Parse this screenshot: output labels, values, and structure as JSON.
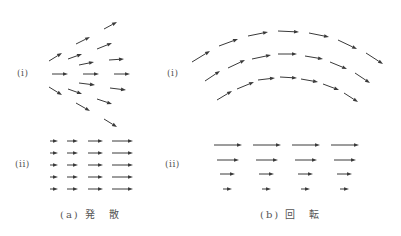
{
  "colors": {
    "arrow": "#3a3a3a",
    "text": "#555555",
    "background": "#ffffff"
  },
  "panels": {
    "a": {
      "caption": "(a) 発　散",
      "sub_i_label": "(i)",
      "sub_ii_label": "(ii)"
    },
    "b": {
      "caption": "(b) 回　転",
      "sub_i_label": "(i)",
      "sub_ii_label": "(ii)"
    }
  },
  "arrows": {
    "a_i": [
      [
        104,
        29,
        117,
        22
      ],
      [
        76,
        44,
        90,
        37
      ],
      [
        97,
        49,
        112,
        43
      ],
      [
        49,
        61,
        62,
        53
      ],
      [
        68,
        59,
        82,
        54
      ],
      [
        79,
        65,
        94,
        62
      ],
      [
        109,
        60,
        124,
        59
      ],
      [
        52,
        74,
        68,
        74
      ],
      [
        83,
        74,
        99,
        74
      ],
      [
        114,
        74,
        130,
        74
      ],
      [
        79,
        83,
        95,
        85
      ],
      [
        110,
        88,
        126,
        90
      ],
      [
        49,
        87,
        62,
        95
      ],
      [
        68,
        89,
        82,
        94
      ],
      [
        97,
        99,
        112,
        104
      ],
      [
        76,
        103,
        90,
        111
      ],
      [
        104,
        119,
        117,
        127
      ]
    ],
    "a_ii": {
      "rows_y": [
        141,
        153,
        165,
        177,
        189
      ],
      "cols": [
        [
          50,
          58
        ],
        [
          67,
          78
        ],
        [
          88,
          103
        ],
        [
          112,
          133
        ]
      ]
    },
    "b_i": [
      [
        192,
        62,
        210,
        51
      ],
      [
        219,
        46,
        238,
        39
      ],
      [
        248,
        36,
        268,
        32
      ],
      [
        278,
        31,
        299,
        32
      ],
      [
        309,
        33,
        329,
        37
      ],
      [
        338,
        40,
        357,
        49
      ],
      [
        366,
        53,
        383,
        64
      ],
      [
        205,
        81,
        220,
        71
      ],
      [
        228,
        68,
        245,
        60
      ],
      [
        252,
        59,
        271,
        55
      ],
      [
        278,
        54,
        297,
        54
      ],
      [
        305,
        56,
        323,
        59
      ],
      [
        330,
        62,
        347,
        69
      ],
      [
        355,
        73,
        370,
        83
      ],
      [
        217,
        100,
        232,
        91
      ],
      [
        237,
        89,
        254,
        82
      ],
      [
        258,
        80,
        275,
        78
      ],
      [
        280,
        77,
        297,
        78
      ],
      [
        301,
        79,
        318,
        82
      ],
      [
        323,
        84,
        339,
        90
      ],
      [
        344,
        93,
        358,
        102
      ]
    ],
    "b_ii": {
      "rows": [
        {
          "y": 145,
          "cols": [
            [
              214,
              242
            ],
            [
              253,
              281
            ],
            [
              292,
              320
            ],
            [
              331,
              359
            ]
          ]
        },
        {
          "y": 160,
          "cols": [
            [
              217,
              239
            ],
            [
              256,
              278
            ],
            [
              295,
              317
            ],
            [
              334,
              356
            ]
          ]
        },
        {
          "y": 174,
          "cols": [
            [
              220,
              235
            ],
            [
              259,
              274
            ],
            [
              298,
              313
            ],
            [
              337,
              352
            ]
          ]
        },
        {
          "y": 189,
          "cols": [
            [
              223,
              232
            ],
            [
              262,
              271
            ],
            [
              301,
              310
            ],
            [
              340,
              349
            ]
          ]
        }
      ]
    }
  }
}
